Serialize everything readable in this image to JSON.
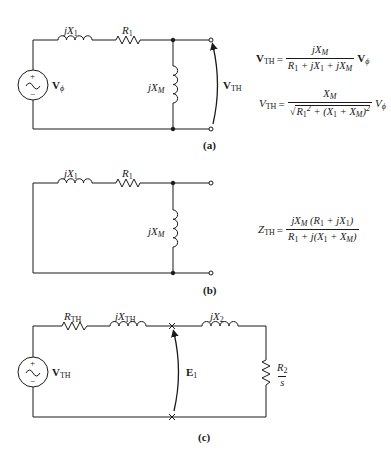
{
  "figure": {
    "panels": [
      {
        "id": "a",
        "caption": "(a)",
        "source_label": "V",
        "source_label_sub": "ϕ",
        "series_inductor_label": "jX",
        "series_inductor_sub": "1",
        "series_resistor_label": "R",
        "series_resistor_sub": "1",
        "shunt_inductor_label": "jX",
        "shunt_inductor_sub": "M",
        "output_voltage_label": "V",
        "output_voltage_sub": "TH",
        "equations": [
          {
            "lhs": "V",
            "lhs_sub": "TH",
            "equals": "=",
            "numerator": "jX_M",
            "denominator": "R_1 + jX_1 + jX_M",
            "rhs": "V_ϕ"
          },
          {
            "lhs": "V",
            "lhs_sub": "TH",
            "equals": "=",
            "numerator": "X_M",
            "denominator": "√(R_1^2 + (X_1 + X_M)^2)",
            "rhs": "V_ϕ"
          }
        ]
      },
      {
        "id": "b",
        "caption": "(b)",
        "series_inductor_label": "jX",
        "series_inductor_sub": "1",
        "series_resistor_label": "R",
        "series_resistor_sub": "1",
        "shunt_inductor_label": "jX",
        "shunt_inductor_sub": "M",
        "equations": [
          {
            "lhs": "Z",
            "lhs_sub": "TH",
            "equals": "=",
            "numerator": "jX_M (R_1 + jX_1)",
            "denominator": "R_1 + j(X_1 + X_M)"
          }
        ]
      },
      {
        "id": "c",
        "caption": "(c)",
        "source_label": "V",
        "source_label_sub": "TH",
        "th_resistor_label": "R",
        "th_resistor_sub": "TH",
        "th_inductor_label": "jX",
        "th_inductor_sub": "TH",
        "rotor_inductor_label": "jX",
        "rotor_inductor_sub": "2",
        "rotor_resistor_num": "R",
        "rotor_resistor_num_sub": "2",
        "rotor_resistor_den": "s",
        "emf_label": "E",
        "emf_sub": "1"
      }
    ],
    "symbols": {
      "plus": "+",
      "minus": "−",
      "tilde": "~",
      "sqrt": "√"
    }
  }
}
